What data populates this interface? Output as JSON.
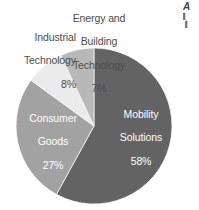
{
  "chart_data": {
    "type": "pie",
    "title": "",
    "subtitle": "",
    "xlabel": "",
    "ylabel": "",
    "grid": false,
    "legend_position": "none",
    "label_mode": "inside-and-outside-callout",
    "start_angle_deg": 0,
    "direction": "clockwise",
    "units": "percent",
    "categories": [
      "Mobility Solutions",
      "Consumer Goods",
      "Industrial Technology",
      "Energy and Building Technology"
    ],
    "values": [
      58,
      27,
      8,
      7
    ],
    "value_labels": [
      "58%",
      "27%",
      "8%",
      "7%"
    ],
    "colors": [
      "#636363",
      "#a2a2a2",
      "#ebebeb",
      "#b8b8b8"
    ],
    "slices": [
      {
        "name": "Mobility Solutions",
        "label_line1": "Mobility",
        "label_line2": "Solutions",
        "value": 58,
        "value_label": "58%",
        "color": "#636363",
        "label_placement": "inside",
        "label_color": "#ffffff"
      },
      {
        "name": "Consumer Goods",
        "label_line1": "Consumer",
        "label_line2": "Goods",
        "value": 27,
        "value_label": "27%",
        "color": "#a2a2a2",
        "label_placement": "inside",
        "label_color": "#ffffff"
      },
      {
        "name": "Industrial Technology",
        "label_line1": "Industrial",
        "label_line2": "Technology",
        "value": 8,
        "value_label": "8%",
        "color": "#ebebeb",
        "label_placement": "outside",
        "label_color": "#4d4d4d"
      },
      {
        "name": "Energy and Building Technology",
        "label_line1": "Energy and",
        "label_line2": "Building",
        "label_line3": "Technology",
        "value": 7,
        "value_label": "7%",
        "color": "#b8b8b8",
        "label_placement": "outside",
        "label_color": "#4d4d4d"
      }
    ]
  },
  "labels": {
    "mobility": {
      "line1": "Mobility",
      "line2": "Solutions",
      "percent": "58%"
    },
    "consumer": {
      "line1": "Consumer",
      "line2": "Goods",
      "percent": "27%"
    },
    "industrial": {
      "line1": "Industrial",
      "line2": "Technology",
      "percent": "8%"
    },
    "energy": {
      "line1": "Energy and",
      "line2": "Building",
      "line3": "Technology",
      "percent": "7%"
    }
  },
  "corner_note": {
    "title_fragment": "A",
    "line1_fragment": "▌",
    "line2_fragment": "▐"
  },
  "geometry": {
    "center_x": 94,
    "center_y": 126,
    "radius": 78
  },
  "palette": {
    "background": "#ffffff",
    "slice_dark": "#636363",
    "slice_mid": "#a2a2a2",
    "slice_light": "#ebebeb",
    "slice_light_mid": "#b8b8b8",
    "text_dark": "#4d4d4d",
    "text_light": "#ffffff"
  }
}
